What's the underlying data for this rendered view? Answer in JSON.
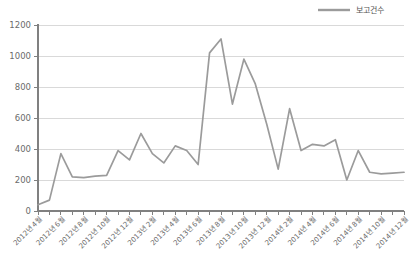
{
  "chart_data": {
    "type": "line",
    "title": "",
    "xlabel": "",
    "ylabel": "",
    "ylim": [
      0,
      1200
    ],
    "yticks": [
      0,
      200,
      400,
      600,
      800,
      1000,
      1200
    ],
    "ytick_labels": [
      "0",
      "200",
      "400",
      "600",
      "800",
      "1000",
      "1200"
    ],
    "grid": true,
    "legend_position": "top-right",
    "legend": [
      "보고건수"
    ],
    "categories": [
      "2012년 4월",
      "2012년 5월",
      "2012년 6월",
      "2012년 7월",
      "2012년 8월",
      "2012년 9월",
      "2012년 10월",
      "2012년 11월",
      "2012년 12월",
      "2013년 1월",
      "2013년 2월",
      "2013년 3월",
      "2013년 4월",
      "2013년 5월",
      "2013년 6월",
      "2013년 7월",
      "2013년 8월",
      "2013년 9월",
      "2013년 10월",
      "2013년 11월",
      "2013년 12월",
      "2014년 1월",
      "2014년 2월",
      "2014년 3월",
      "2014년 4월",
      "2014년 5월",
      "2014년 6월",
      "2014년 7월",
      "2014년 8월",
      "2014년 9월",
      "2014년 10월",
      "2014년 11월",
      "2014년 12월"
    ],
    "xtick_labels": [
      "2012년 4월",
      "2012년 6월",
      "2012년 8월",
      "2012년 10월",
      "2012년 12월",
      "2013년 2월",
      "2013년 4월",
      "2013년 6월",
      "2013년 8월",
      "2013년 10월",
      "2013년 12월",
      "2014년 2월",
      "2014년 4월",
      "2014년 6월",
      "2014년 8월",
      "2014년 10월",
      "2014년 12월"
    ],
    "series": [
      {
        "name": "보고건수",
        "color": "#9b9b9b",
        "values": [
          40,
          70,
          370,
          220,
          215,
          225,
          230,
          390,
          330,
          500,
          370,
          310,
          420,
          390,
          300,
          1020,
          1110,
          690,
          980,
          820,
          560,
          270,
          660,
          390,
          430,
          420,
          460,
          200,
          390,
          250,
          240,
          245,
          250
        ]
      }
    ]
  },
  "legend": {
    "label": "보고건수",
    "color": "#9b9b9b"
  },
  "axis": {
    "y_min_label": "0",
    "y_max_label": "1200"
  }
}
